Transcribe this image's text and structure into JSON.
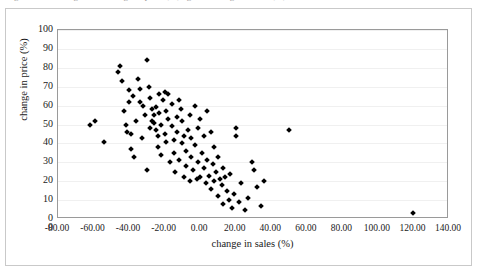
{
  "figure": {
    "clipped_caption": "Figure   Scatter diagram of change in price (%) against change in sales (%)"
  },
  "chart_data": {
    "type": "scatter",
    "title": "",
    "xlabel": "change in sales (%)",
    "ylabel": "change in price (%)",
    "xlim": [
      -80,
      140
    ],
    "ylim": [
      0,
      100
    ],
    "xticks": [
      "-80.00",
      "-60.00",
      "-40.00",
      "-20.00",
      "0.00",
      "20.00",
      "40.00",
      "60.00",
      "80.00",
      "100.00",
      "120.00",
      "140.00"
    ],
    "xtick_values": [
      -80,
      -60,
      -40,
      -20,
      0,
      20,
      40,
      60,
      80,
      100,
      120,
      140
    ],
    "yticks": [
      "100",
      "90",
      "80",
      "70",
      "60",
      "50",
      "40",
      "30",
      "20",
      "10",
      "0",
      "0"
    ],
    "ytick_values": [
      100,
      90,
      80,
      70,
      60,
      50,
      40,
      30,
      20,
      10,
      0,
      -5
    ],
    "grid": "horizontal",
    "legend": "none",
    "marker": "diamond",
    "marker_color": "#000000",
    "series": [
      {
        "name": "observations",
        "points": [
          [
            -62,
            50
          ],
          [
            -59,
            52
          ],
          [
            -54,
            41
          ],
          [
            -46,
            78
          ],
          [
            -45,
            81
          ],
          [
            -44,
            73
          ],
          [
            -43,
            57
          ],
          [
            -42,
            50
          ],
          [
            -41,
            46
          ],
          [
            -40,
            68
          ],
          [
            -40,
            62
          ],
          [
            -39,
            45
          ],
          [
            -39,
            37
          ],
          [
            -38,
            65
          ],
          [
            -37,
            33
          ],
          [
            -36,
            52
          ],
          [
            -35,
            74
          ],
          [
            -34,
            69
          ],
          [
            -34,
            62
          ],
          [
            -33,
            43
          ],
          [
            -32,
            60
          ],
          [
            -31,
            55
          ],
          [
            -30,
            26
          ],
          [
            -30,
            84
          ],
          [
            -29,
            70
          ],
          [
            -28,
            64
          ],
          [
            -28,
            48
          ],
          [
            -27,
            58
          ],
          [
            -27,
            52
          ],
          [
            -26,
            55
          ],
          [
            -26,
            51
          ],
          [
            -25,
            47
          ],
          [
            -25,
            59
          ],
          [
            -24,
            44
          ],
          [
            -24,
            38
          ],
          [
            -23,
            66
          ],
          [
            -23,
            56
          ],
          [
            -22,
            34
          ],
          [
            -22,
            50
          ],
          [
            -21,
            63
          ],
          [
            -20,
            67
          ],
          [
            -20,
            45
          ],
          [
            -19,
            41
          ],
          [
            -19,
            57
          ],
          [
            -18,
            66
          ],
          [
            -18,
            53
          ],
          [
            -17,
            30
          ],
          [
            -16,
            49
          ],
          [
            -16,
            61
          ],
          [
            -15,
            35
          ],
          [
            -15,
            42
          ],
          [
            -14,
            25
          ],
          [
            -13,
            54
          ],
          [
            -13,
            46
          ],
          [
            -12,
            63
          ],
          [
            -12,
            31
          ],
          [
            -11,
            58
          ],
          [
            -10,
            40
          ],
          [
            -10,
            52
          ],
          [
            -9,
            22
          ],
          [
            -9,
            44
          ],
          [
            -8,
            28
          ],
          [
            -8,
            36
          ],
          [
            -7,
            47
          ],
          [
            -6,
            20
          ],
          [
            -6,
            55
          ],
          [
            -5,
            33
          ],
          [
            -5,
            43
          ],
          [
            -4,
            26
          ],
          [
            -3,
            60
          ],
          [
            -3,
            39
          ],
          [
            -2,
            21
          ],
          [
            -1,
            48
          ],
          [
            -1,
            30
          ],
          [
            0,
            53
          ],
          [
            0,
            22
          ],
          [
            1,
            35
          ],
          [
            2,
            27
          ],
          [
            2,
            44
          ],
          [
            3,
            19
          ],
          [
            4,
            57
          ],
          [
            4,
            31
          ],
          [
            5,
            23
          ],
          [
            6,
            46
          ],
          [
            6,
            16
          ],
          [
            7,
            29
          ],
          [
            8,
            20
          ],
          [
            8,
            38
          ],
          [
            9,
            25
          ],
          [
            10,
            12
          ],
          [
            10,
            33
          ],
          [
            11,
            21
          ],
          [
            12,
            18
          ],
          [
            13,
            27
          ],
          [
            13,
            8
          ],
          [
            14,
            22
          ],
          [
            15,
            15
          ],
          [
            16,
            10
          ],
          [
            17,
            24
          ],
          [
            18,
            6
          ],
          [
            19,
            13
          ],
          [
            20,
            48
          ],
          [
            20,
            44
          ],
          [
            22,
            9
          ],
          [
            23,
            19
          ],
          [
            25,
            5
          ],
          [
            27,
            11
          ],
          [
            29,
            30
          ],
          [
            30,
            26
          ],
          [
            32,
            17
          ],
          [
            34,
            7
          ],
          [
            36,
            20
          ],
          [
            50,
            47
          ],
          [
            120,
            3
          ]
        ]
      }
    ]
  }
}
